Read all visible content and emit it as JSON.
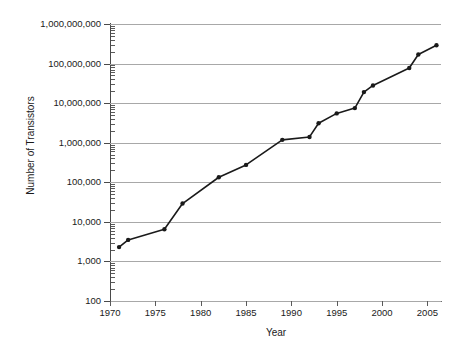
{
  "chart_data": {
    "type": "line",
    "title": "",
    "xlabel": "Year",
    "ylabel": "Number of Transistors",
    "yscale": "log",
    "xlim": [
      1970,
      2006.5
    ],
    "ylim": [
      100,
      1000000000
    ],
    "grid": true,
    "legend": "none",
    "marker": "filled-circle",
    "line_color": "#1a1a1a",
    "grid_color": "#a8a8a8",
    "y_tick_labels": [
      "100",
      "1,000",
      "10,000",
      "100,000",
      "1,000,000",
      "10,000,000",
      "100,000,000",
      "1,000,000,000"
    ],
    "y_tick_values": [
      100,
      1000,
      10000,
      100000,
      1000000,
      10000000,
      100000000,
      1000000000
    ],
    "x_tick_labels": [
      "1970",
      "1975",
      "1980",
      "1985",
      "1990",
      "1995",
      "2000",
      "2005"
    ],
    "x_tick_values": [
      1970,
      1975,
      1980,
      1985,
      1990,
      1995,
      2000,
      2005
    ],
    "x": [
      1971,
      1972,
      1976,
      1978,
      1982,
      1985,
      1989,
      1992,
      1993,
      1995,
      1997,
      1998,
      1999,
      2003,
      2004,
      2006
    ],
    "values": [
      2300,
      3500,
      6500,
      29000,
      134000,
      275000,
      1180000,
      1400000,
      3100000,
      5500000,
      7500000,
      19000000,
      28000000,
      77000000,
      170000000,
      291000000
    ],
    "series": [
      {
        "name": "Number of Transistors",
        "points": [
          {
            "year": 1971,
            "transistors": 2300
          },
          {
            "year": 1972,
            "transistors": 3500
          },
          {
            "year": 1976,
            "transistors": 6500
          },
          {
            "year": 1978,
            "transistors": 29000
          },
          {
            "year": 1982,
            "transistors": 134000
          },
          {
            "year": 1985,
            "transistors": 275000
          },
          {
            "year": 1989,
            "transistors": 1180000
          },
          {
            "year": 1992,
            "transistors": 1400000
          },
          {
            "year": 1993,
            "transistors": 3100000
          },
          {
            "year": 1995,
            "transistors": 5500000
          },
          {
            "year": 1997,
            "transistors": 7500000
          },
          {
            "year": 1998,
            "transistors": 19000000
          },
          {
            "year": 1999,
            "transistors": 28000000
          },
          {
            "year": 2003,
            "transistors": 77000000
          },
          {
            "year": 2004,
            "transistors": 170000000
          },
          {
            "year": 2006,
            "transistors": 291000000
          }
        ]
      }
    ]
  }
}
